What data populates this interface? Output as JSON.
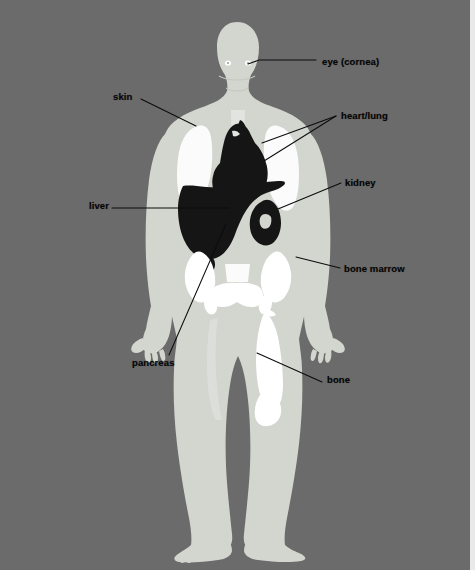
{
  "figure": {
    "background_color": "#6b6b6b",
    "body_color": "#d2d6cf",
    "bone_color": "#ffffff",
    "organ_dark_color": "#151515",
    "label_color": "#050505",
    "leader_color": "#0c0c0c"
  },
  "labels": [
    {
      "id": "eye",
      "text": "eye (cornea)",
      "x": 322,
      "y": 57,
      "anchor": "left"
    },
    {
      "id": "skin",
      "text": "skin",
      "x": 113,
      "y": 92,
      "anchor": "left"
    },
    {
      "id": "heart_lung",
      "text": "heart/lung",
      "x": 341,
      "y": 111,
      "anchor": "left"
    },
    {
      "id": "kidney",
      "text": "kidney",
      "x": 345,
      "y": 178,
      "anchor": "left"
    },
    {
      "id": "liver",
      "text": "liver",
      "x": 89,
      "y": 205,
      "anchor": "left"
    },
    {
      "id": "bone_marrow",
      "text": "bone marrow",
      "x": 344,
      "y": 264,
      "anchor": "left"
    },
    {
      "id": "pancreas",
      "text": "pancreas",
      "x": 132,
      "y": 362,
      "anchor": "left"
    },
    {
      "id": "bone",
      "text": "bone",
      "x": 327,
      "y": 379,
      "anchor": "left"
    }
  ],
  "leaders": [
    {
      "id": "leader-eye",
      "points": "316,60 259,60 248,64"
    },
    {
      "id": "leader-skin",
      "points": "141,99 196,126"
    },
    {
      "id": "leader-heart",
      "points": "336,116 262,143"
    },
    {
      "id": "leader-lung",
      "points": "336,116 264,161"
    },
    {
      "id": "leader-kidney",
      "points": "341,183 278,209"
    },
    {
      "id": "leader-liver",
      "points": "112,208 229,208"
    },
    {
      "id": "leader-bonemarrow",
      "points": "340,268 296,257"
    },
    {
      "id": "leader-pancreas",
      "points": "169,355 226,224"
    },
    {
      "id": "leader-bone",
      "points": "322,382 257,353"
    }
  ],
  "organs": [
    {
      "id": "eye-left",
      "name": "left cornea",
      "tone": "bright"
    },
    {
      "id": "eye-right",
      "name": "right cornea",
      "tone": "bright"
    },
    {
      "id": "lung-left",
      "name": "left lung",
      "tone": "bright"
    },
    {
      "id": "lung-right",
      "name": "right lung",
      "tone": "bright"
    },
    {
      "id": "heart",
      "name": "heart",
      "tone": "dark"
    },
    {
      "id": "liver",
      "name": "liver",
      "tone": "dark"
    },
    {
      "id": "kidney",
      "name": "kidney",
      "tone": "dark"
    },
    {
      "id": "pelvis",
      "name": "pelvic marrow",
      "tone": "bright"
    },
    {
      "id": "femur",
      "name": "femur bone",
      "tone": "bright"
    },
    {
      "id": "spine",
      "name": "spine",
      "tone": "bright"
    }
  ]
}
